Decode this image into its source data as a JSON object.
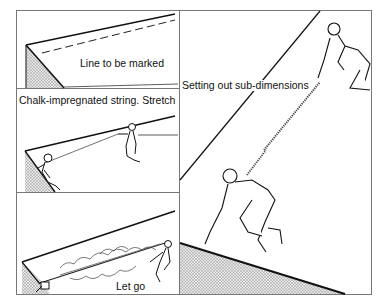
{
  "figure": {
    "panels": [
      {
        "id": "mark",
        "label": "Line to be marked"
      },
      {
        "id": "stretch",
        "label": "Chalk-impregnated string. Stretch"
      },
      {
        "id": "letgo",
        "label": "Let go"
      },
      {
        "id": "subdim",
        "label": "Setting out sub-dimensions"
      }
    ]
  },
  "colors": {
    "line": "#1a1a1a",
    "frame": "#777777",
    "hatch": "#bdbdbd"
  }
}
